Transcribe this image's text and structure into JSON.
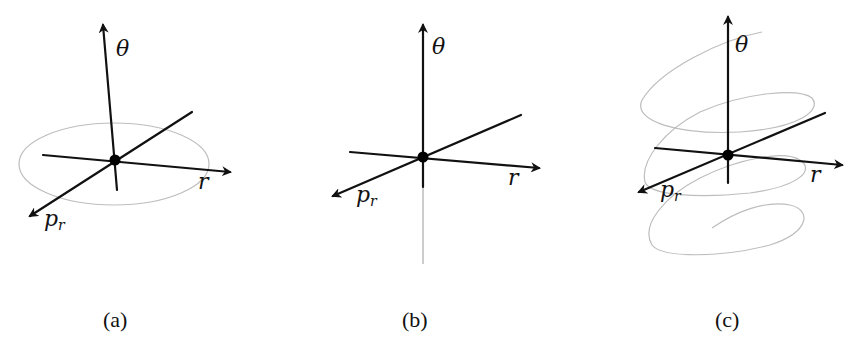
{
  "figure": {
    "panels": [
      {
        "id": "a",
        "caption": "(a)",
        "axes": {
          "vertical": "θ",
          "horizontal": "r",
          "depth_main": "p",
          "depth_sub": "r"
        },
        "description": "Closed elliptical orbit in the r–p_r plane"
      },
      {
        "id": "b",
        "caption": "(b)",
        "axes": {
          "vertical": "θ",
          "horizontal": "r",
          "depth_main": "p",
          "depth_sub": "r"
        },
        "description": "Fixed point with trajectory along θ axis"
      },
      {
        "id": "c",
        "caption": "(c)",
        "axes": {
          "vertical": "θ",
          "horizontal": "r",
          "depth_main": "p",
          "depth_sub": "r"
        },
        "description": "Helical spiral trajectory around θ axis"
      }
    ],
    "colors": {
      "axis": "#111111",
      "orbit": "#bdbdbd",
      "thin_axis": "#9a9a9a"
    }
  }
}
